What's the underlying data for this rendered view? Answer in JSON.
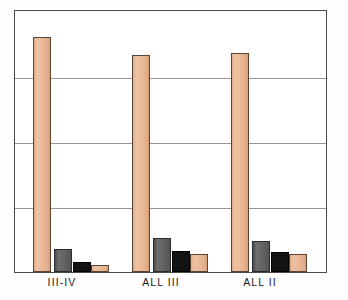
{
  "chart_data": {
    "type": "bar",
    "title": "",
    "subtitle": "",
    "xlabel": "",
    "ylabel": "",
    "ylim": [
      0,
      100
    ],
    "grid": true,
    "gridline_values": [
      20,
      40,
      60,
      80
    ],
    "axis_tick_labels": [],
    "legend": [],
    "legend_position": "none",
    "categories": [
      "III-IV",
      "ALL III",
      "ALL II"
    ],
    "series": [
      {
        "name": "series-1",
        "color": "#e9bb99",
        "style": "peach",
        "values": [
          90,
          83,
          84
        ]
      },
      {
        "name": "series-2",
        "color": "#636363",
        "style": "gray",
        "values": [
          9,
          13,
          12
        ]
      },
      {
        "name": "series-3",
        "color": "#121212",
        "style": "black",
        "values": [
          4,
          8,
          7.5
        ]
      },
      {
        "name": "series-4",
        "color": "#e9bb99",
        "style": "peach",
        "values": [
          2.5,
          7,
          7
        ]
      }
    ],
    "annotations": []
  },
  "axes": {
    "frame_color": "#4a4a4a",
    "grid_color": "#6e6e6e",
    "background": "#ffffff"
  },
  "labels": {
    "cat_0": "III-IV",
    "cat_1": "ALL III",
    "cat_2": "ALL II"
  }
}
